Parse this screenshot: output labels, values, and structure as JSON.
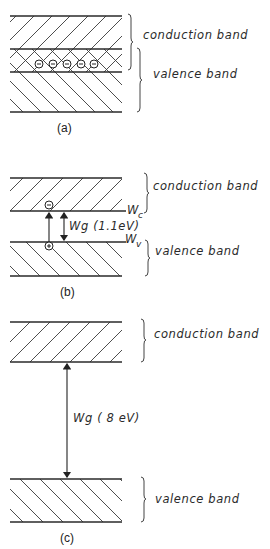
{
  "figure": {
    "panels": [
      {
        "id": "a",
        "caption": "(a)",
        "bands": [
          {
            "name": "conduction band",
            "label": "conduction band"
          },
          {
            "name": "valence band",
            "label": "valence band"
          }
        ],
        "electrons_count": 5,
        "electron_symbol": "−",
        "note": "conduction and valence bands overlap"
      },
      {
        "id": "b",
        "caption": "(b)",
        "bands": [
          {
            "name": "conduction band",
            "label": "conduction band",
            "edge_label": "W",
            "edge_sub": "c"
          },
          {
            "name": "valence band",
            "label": "valence band",
            "edge_label": "W",
            "edge_sub": "v"
          }
        ],
        "gap_label": "Wg (1.1eV)",
        "gap_energy": "1.1eV",
        "electron_symbol": "−",
        "hole_symbol": "+"
      },
      {
        "id": "c",
        "caption": "(c)",
        "bands": [
          {
            "name": "conduction band",
            "label": "conduction band"
          },
          {
            "name": "valence band",
            "label": "valence band"
          }
        ],
        "gap_label": "Wg ( 8 eV)",
        "gap_energy": "8eV"
      }
    ]
  }
}
